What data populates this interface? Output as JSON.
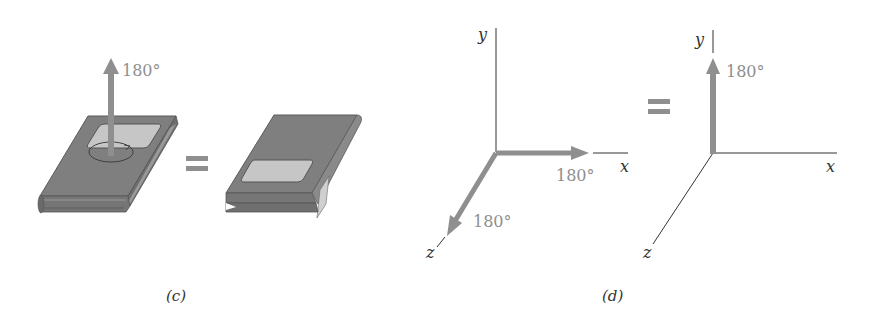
{
  "panel_c": {
    "caption": "(c)",
    "rotation_label": "180°",
    "equals": "="
  },
  "panel_d": {
    "caption": "(d)",
    "left_axes": {
      "y_label": "y",
      "x_label": "x",
      "z_label": "z",
      "x_rotation_label": "180°",
      "z_rotation_label": "180°"
    },
    "equals": "=",
    "right_axes": {
      "y_label": "y",
      "x_label": "x",
      "z_label": "z",
      "y_rotation_label": "180°"
    }
  },
  "colors": {
    "arrow": "#8f8f8f",
    "book_cover": "#7d7d7d",
    "book_label": "#c9c9c9",
    "axis_line": "#333333"
  }
}
